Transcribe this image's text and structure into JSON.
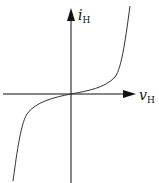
{
  "diagram": {
    "type": "i-v characteristic curve",
    "y_axis": {
      "label": "i",
      "subscript": "H"
    },
    "x_axis": {
      "label": "v",
      "subscript": "H"
    },
    "colors": {
      "axis": "#111111",
      "curve": "#333333",
      "background": "#ffffff"
    },
    "curve_shape": "odd-symmetric cubic-like: flat near origin, rising steeply for positive v, falling steeply for negative v"
  }
}
